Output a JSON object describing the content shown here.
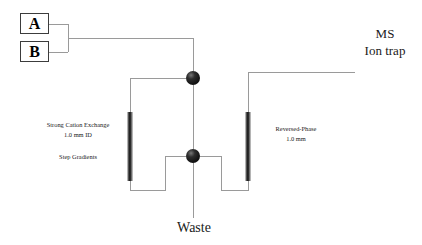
{
  "diagram": {
    "background_color": "#ffffff",
    "line_color": "#9a9a9a",
    "node_color": "#1b1b1b",
    "text_color": "#1a1a1a"
  },
  "reservoirs": [
    {
      "id": "a",
      "label": "A"
    },
    {
      "id": "b",
      "label": "B"
    }
  ],
  "columns": [
    {
      "id": "scx",
      "name_line1": "Strong Cation Exchange",
      "name_line2": "1.0 mm ID",
      "mode": "Step Gradients"
    },
    {
      "id": "rp",
      "name_line1": "Reversed-Phase",
      "name_line2": "1.0 mm"
    }
  ],
  "detector": {
    "line1": "MS",
    "line2": "Ion trap"
  },
  "outlet": {
    "label": "Waste"
  },
  "junctions": [
    {
      "id": "upper-valve",
      "x": 193,
      "y": 78
    },
    {
      "id": "lower-valve",
      "x": 193,
      "y": 156
    }
  ]
}
